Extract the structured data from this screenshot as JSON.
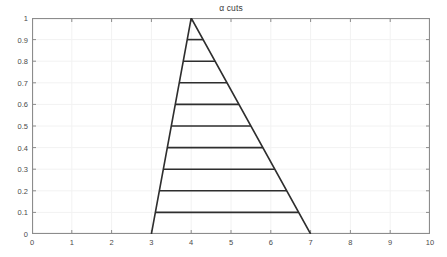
{
  "figure": {
    "width": 447,
    "height": 257,
    "background": "#ffffff"
  },
  "chart_data": {
    "type": "line",
    "title": "α cuts",
    "xlabel": "",
    "ylabel": "",
    "xlim": [
      0,
      10
    ],
    "ylim": [
      0,
      1
    ],
    "grid": true,
    "legend": null,
    "xticks": [
      "0",
      "1",
      "2",
      "3",
      "4",
      "5",
      "6",
      "7",
      "8",
      "9",
      "10"
    ],
    "xtick_values": [
      0,
      1,
      2,
      3,
      4,
      5,
      6,
      7,
      8,
      9,
      10
    ],
    "yticks": [
      "0",
      "0.1",
      "0.2",
      "0.3",
      "0.4",
      "0.5",
      "0.6",
      "0.7",
      "0.8",
      "0.9",
      "1"
    ],
    "ytick_values": [
      0,
      0.1,
      0.2,
      0.3,
      0.4,
      0.5,
      0.6,
      0.7,
      0.8,
      0.9,
      1
    ],
    "series": [
      {
        "name": "triangular membership function",
        "x": [
          3,
          4,
          7
        ],
        "y": [
          0,
          1,
          0
        ],
        "color": "#2e2e2e",
        "width": 1.6
      },
      {
        "name": "alpha-cut 0.9",
        "x": [
          3.9,
          4.3
        ],
        "y": [
          0.9,
          0.9
        ],
        "color": "#2e2e2e",
        "width": 1.6
      },
      {
        "name": "alpha-cut 0.8",
        "x": [
          3.8,
          4.6
        ],
        "y": [
          0.8,
          0.8
        ],
        "color": "#2e2e2e",
        "width": 1.6
      },
      {
        "name": "alpha-cut 0.7",
        "x": [
          3.7,
          4.9
        ],
        "y": [
          0.7,
          0.7
        ],
        "color": "#2e2e2e",
        "width": 1.6
      },
      {
        "name": "alpha-cut 0.6",
        "x": [
          3.6,
          5.2
        ],
        "y": [
          0.6,
          0.6
        ],
        "color": "#2e2e2e",
        "width": 1.6
      },
      {
        "name": "alpha-cut 0.5",
        "x": [
          3.5,
          5.5
        ],
        "y": [
          0.5,
          0.5
        ],
        "color": "#2e2e2e",
        "width": 1.6
      },
      {
        "name": "alpha-cut 0.4",
        "x": [
          3.4,
          5.8
        ],
        "y": [
          0.4,
          0.4
        ],
        "color": "#2e2e2e",
        "width": 1.6
      },
      {
        "name": "alpha-cut 0.3",
        "x": [
          3.3,
          6.1
        ],
        "y": [
          0.3,
          0.3
        ],
        "color": "#2e2e2e",
        "width": 1.6
      },
      {
        "name": "alpha-cut 0.2",
        "x": [
          3.2,
          6.4
        ],
        "y": [
          0.2,
          0.2
        ],
        "color": "#2e2e2e",
        "width": 1.6
      },
      {
        "name": "alpha-cut 0.1",
        "x": [
          3.1,
          6.7
        ],
        "y": [
          0.1,
          0.1
        ],
        "color": "#2e2e2e",
        "width": 1.6
      }
    ],
    "alpha_levels": [
      0.1,
      0.2,
      0.3,
      0.4,
      0.5,
      0.6,
      0.7,
      0.8,
      0.9
    ],
    "triangle": {
      "left_support": 3,
      "peak": 4,
      "right_support": 7,
      "peak_membership": 1
    },
    "colors": {
      "line": "#2e2e2e",
      "axis": "#8c8c8c",
      "grid": "#f2f2f2",
      "tick_label": "#4a4a4a",
      "title": "#3a3a3a",
      "background": "#ffffff"
    }
  }
}
